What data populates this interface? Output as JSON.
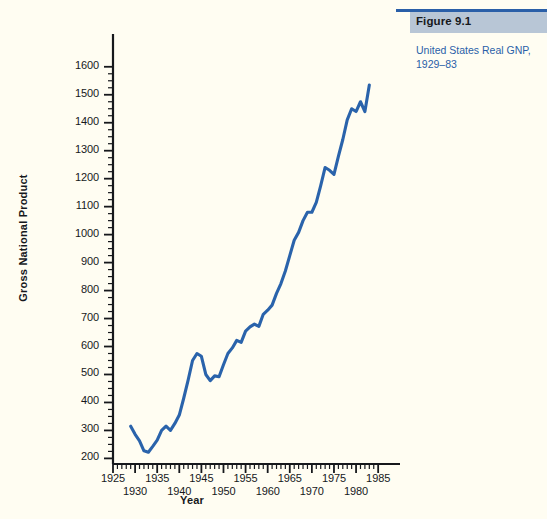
{
  "figure": {
    "badge_label": "Figure 9.1",
    "caption_line1": "United States Real GNP,",
    "caption_line2": "1929–83",
    "accent_color": "#2a5fa8",
    "badge_color": "#b8c6d6",
    "background_color": "#fffdf2"
  },
  "chart_data": {
    "type": "line",
    "title": "United States Real GNP, 1929–83",
    "xlabel": "Year",
    "ylabel": "Gross National Product",
    "xlim": [
      1925,
      1987
    ],
    "ylim": [
      180,
      1660
    ],
    "grid": false,
    "legend": null,
    "line_color": "#2a63ab",
    "axis_color": "#16181c",
    "x_major_ticks": [
      1925,
      1930,
      1935,
      1940,
      1945,
      1950,
      1955,
      1960,
      1965,
      1970,
      1975,
      1980,
      1985
    ],
    "x_tick_labels_upper": [
      "1925",
      "1935",
      "1945",
      "1955",
      "1965",
      "1975",
      "1985"
    ],
    "x_tick_labels_upper_values": [
      1925,
      1935,
      1945,
      1955,
      1965,
      1975,
      1985
    ],
    "x_tick_labels_lower": [
      "1930",
      "1940",
      "1950",
      "1960",
      "1970",
      "1980"
    ],
    "x_tick_labels_lower_values": [
      1930,
      1940,
      1950,
      1960,
      1970,
      1980
    ],
    "x_minor_tick_step": 1,
    "y_major_ticks": [
      200,
      300,
      400,
      500,
      600,
      700,
      800,
      900,
      1000,
      1100,
      1200,
      1300,
      1400,
      1500,
      1600
    ],
    "y_tick_labels": [
      "200",
      "300",
      "400",
      "500",
      "600",
      "700",
      "800",
      "900",
      "1000",
      "1100",
      "1200",
      "1300",
      "1400",
      "1500",
      "1600"
    ],
    "y_minor_tick_step": 25,
    "series": [
      {
        "name": "Real GNP",
        "x": [
          1929,
          1930,
          1931,
          1932,
          1933,
          1934,
          1935,
          1936,
          1937,
          1938,
          1939,
          1940,
          1941,
          1942,
          1943,
          1944,
          1945,
          1946,
          1947,
          1948,
          1949,
          1950,
          1951,
          1952,
          1953,
          1954,
          1955,
          1956,
          1957,
          1958,
          1959,
          1960,
          1961,
          1962,
          1963,
          1964,
          1965,
          1966,
          1967,
          1968,
          1969,
          1970,
          1971,
          1972,
          1973,
          1974,
          1975,
          1976,
          1977,
          1978,
          1979,
          1980,
          1981,
          1982,
          1983
        ],
        "values": [
          315,
          286,
          263,
          227,
          222,
          243,
          265,
          300,
          315,
          300,
          325,
          355,
          415,
          480,
          550,
          575,
          565,
          500,
          478,
          495,
          492,
          535,
          575,
          595,
          622,
          615,
          655,
          670,
          680,
          672,
          715,
          730,
          748,
          790,
          825,
          870,
          925,
          980,
          1008,
          1050,
          1080,
          1080,
          1115,
          1175,
          1240,
          1230,
          1215,
          1280,
          1340,
          1410,
          1450,
          1440,
          1475,
          1440,
          1535
        ],
        "units": "billions of 1972 dollars"
      }
    ]
  }
}
